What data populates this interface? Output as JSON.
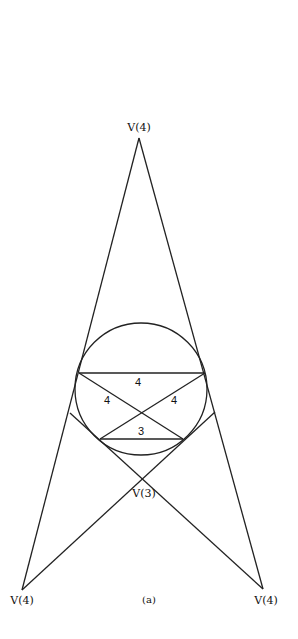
{
  "figure": {
    "caption": "(a)",
    "colors": {
      "stroke": "#222222",
      "text": "#111111",
      "background": "#ffffff"
    }
  },
  "vertices": {
    "top": {
      "label": "V(4)",
      "x": 139,
      "y": 138
    },
    "bottom_left": {
      "label": "V(4)",
      "x": 22,
      "y": 590
    },
    "bottom_right": {
      "label": "V(4)",
      "x": 263,
      "y": 589
    },
    "center": {
      "label": "V(3)",
      "x": 141,
      "y": 480
    }
  },
  "circle": {
    "cx": 141,
    "cy": 389,
    "r": 66
  },
  "edges": {
    "top_chord": {
      "label": "4"
    },
    "left_diagonal": {
      "label": "4"
    },
    "right_diagonal": {
      "label": "4"
    },
    "bottom_chord": {
      "label": "3"
    }
  }
}
